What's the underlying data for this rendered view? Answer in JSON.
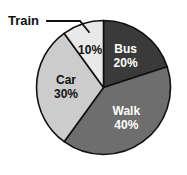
{
  "chart_data": {
    "type": "pie",
    "title": "",
    "subtitle": "",
    "xlabel": "",
    "ylabel": "",
    "legend_position": "none",
    "grid": false,
    "units": "percent",
    "total": 100,
    "start_angle_deg": 0,
    "direction": "clockwise",
    "categories": [
      "Bus",
      "Walk",
      "Car",
      "Train"
    ],
    "values": [
      20,
      30,
      40,
      10
    ],
    "slices": [
      {
        "name": "Bus",
        "label": "Bus",
        "value": 20,
        "value_label": "20%",
        "color": "#3a3a3a",
        "text_color": "#ffffff",
        "label_placement": "inside",
        "start_deg": 0,
        "end_deg": 72
      },
      {
        "name": "Walk",
        "label": "Walk",
        "value": 40,
        "value_label": "40%",
        "color": "#6e6e6e",
        "text_color": "#ffffff",
        "label_placement": "inside",
        "start_deg": 72,
        "end_deg": 216
      },
      {
        "name": "Car",
        "label": "Car",
        "value": 30,
        "value_label": "30%",
        "color": "#cccccc",
        "text_color": "#111111",
        "label_placement": "inside",
        "start_deg": 216,
        "end_deg": 324
      },
      {
        "name": "Train",
        "label": "Train",
        "value": 10,
        "value_label": "10%",
        "color": "#e9e9e9",
        "text_color": "#111111",
        "label_placement": "callout",
        "start_deg": 324,
        "end_deg": 360
      }
    ],
    "callouts": [
      {
        "name": "train-callout",
        "text": "Train",
        "for_slice": "Train"
      }
    ],
    "style": {
      "background": "#ffffff",
      "outline_color": "#111111",
      "leader_color": "#111111"
    }
  }
}
